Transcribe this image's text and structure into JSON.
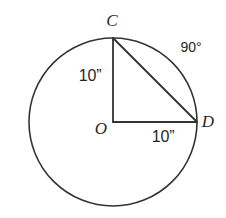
{
  "figure": {
    "kind": "circle-with-inscribed-right-triangle",
    "background_color": "#ffffff",
    "stroke_color": "#333333",
    "text_color": "#262626",
    "circle": {
      "center_label": "O",
      "center_x": 113,
      "center_y": 122,
      "radius": 84,
      "stroke_width": 1.6
    },
    "points": [
      {
        "id": "C",
        "label": "C",
        "x": 113,
        "y": 38,
        "label_x": 112,
        "label_y": 20
      },
      {
        "id": "D",
        "label": "D",
        "x": 197,
        "y": 122,
        "label_x": 208,
        "label_y": 121
      },
      {
        "id": "O",
        "label": "O",
        "x": 113,
        "y": 122,
        "label_x": 101,
        "label_y": 128
      }
    ],
    "segments": [
      {
        "id": "OC",
        "from": "O",
        "to": "C",
        "kind": "radius",
        "stroke_width": 1.8
      },
      {
        "id": "OD",
        "from": "O",
        "to": "D",
        "kind": "radius",
        "stroke_width": 1.8
      },
      {
        "id": "CD",
        "from": "C",
        "to": "D",
        "kind": "chord",
        "stroke_width": 1.8
      }
    ],
    "labels": {
      "radius_vertical": "10”",
      "radius_horizontal": "10”",
      "arc_angle": "90°",
      "point_c": "C",
      "point_d": "D",
      "point_o": "O"
    },
    "label_positions": {
      "radius_vertical_x": 90,
      "radius_vertical_y": 76,
      "radius_horizontal_x": 163,
      "radius_horizontal_y": 137,
      "arc_angle_x": 191,
      "arc_angle_y": 47
    }
  }
}
